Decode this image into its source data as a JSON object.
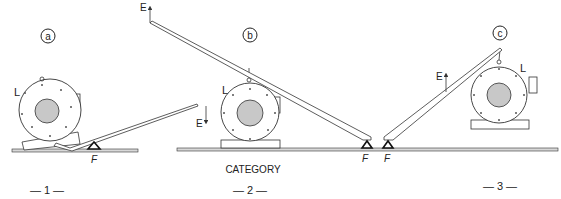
{
  "caption": "CATEGORY",
  "panels": [
    {
      "id": "a",
      "badge": "a",
      "number": "— 1 —",
      "load_label": "L",
      "effort_label": "E",
      "fulcrum_label": "F",
      "effort_direction": "down"
    },
    {
      "id": "b",
      "badge": "b",
      "number": "— 2 —",
      "load_label": "L",
      "effort_label": "E",
      "fulcrum_label": "F",
      "effort_direction": "up"
    },
    {
      "id": "c",
      "badge": "c",
      "number": "— 3 —",
      "load_label": "L",
      "effort_label": "E",
      "fulcrum_label": "F",
      "effort_direction": "up"
    }
  ],
  "colors": {
    "line": "#333333",
    "rotor": "#c8c8c8",
    "ground": "#d8d8d8"
  }
}
